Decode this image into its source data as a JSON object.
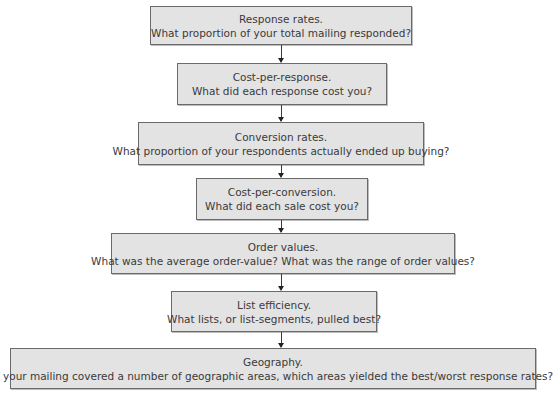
{
  "flowchart": {
    "steps": [
      {
        "title": "Response rates.",
        "question": "What proportion of your total mailing responded?"
      },
      {
        "title": "Cost-per-response.",
        "question": "What did each response cost you?"
      },
      {
        "title": "Conversion rates.",
        "question": "What proportion of your respondents actually ended up buying?"
      },
      {
        "title": "Cost-per-conversion.",
        "question": "What did each sale cost you?"
      },
      {
        "title": "Order values.",
        "question": "What was the average order-value? What was the range of order values?"
      },
      {
        "title": "List efficiency.",
        "question": "What lists, or list-segments, pulled best?"
      },
      {
        "title": "Geography.",
        "question": "If your mailing covered a number of geographic areas, which areas yielded the best/worst response rates?"
      }
    ],
    "colors": {
      "box_fill": "#e3e3e3",
      "box_border": "#6a6a6a",
      "text": "#3a3a3a",
      "arrow": "#3a3a3a"
    }
  }
}
